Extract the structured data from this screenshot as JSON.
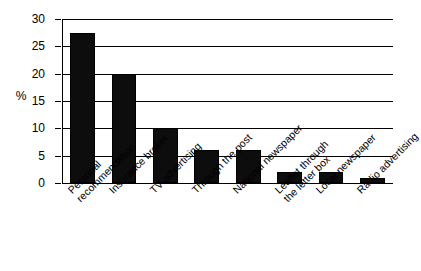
{
  "chart_data": {
    "type": "bar",
    "title": "",
    "xlabel": "",
    "ylabel": "%",
    "ylim": [
      0,
      30
    ],
    "yticks": [
      0,
      5,
      10,
      15,
      20,
      25,
      30
    ],
    "ytick_labels": [
      "0",
      "5",
      "10",
      "15",
      "20",
      "25",
      "30"
    ],
    "grid": true,
    "legend": "none",
    "orientation": "vertical",
    "bar_color": "#000000",
    "categories": [
      "Personal\nrecommendation",
      "Insurance broker",
      "TV advertising",
      "Through the post",
      "National newspaper",
      "Leaflet through\nthe letter box",
      "Local newspaper",
      "Radio advertising"
    ],
    "values": [
      27.4,
      20,
      10,
      6,
      6,
      2,
      2,
      1
    ]
  },
  "axis": {
    "unit_label": "%"
  }
}
